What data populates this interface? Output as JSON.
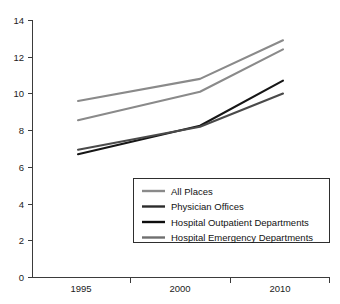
{
  "chart_data": {
    "type": "line",
    "title": "",
    "xlabel": "",
    "ylabel": "",
    "x": [
      "1995",
      "2000",
      "2010"
    ],
    "categories": [
      "1995",
      "2000",
      "2010"
    ],
    "xtick_labels": [
      "1995",
      "2000",
      "2010"
    ],
    "ytick_labels": [
      "0",
      "2",
      "4",
      "6",
      "8",
      "10",
      "12",
      "14"
    ],
    "ytick_values": [
      0,
      2,
      4,
      6,
      8,
      10,
      12,
      14
    ],
    "ylim": [
      0,
      14
    ],
    "grid": false,
    "legend_position": "inside-lower-right",
    "series": [
      {
        "name": "All Places",
        "color": "#8a8a8a",
        "values": [
          9.6,
          10.8,
          12.9
        ]
      },
      {
        "name": "Physician Offices",
        "color": "#8a8a8a",
        "values": [
          8.55,
          10.1,
          12.4
        ]
      },
      {
        "name": "Hospital Outpatient Departments",
        "color": "#161616",
        "values": [
          6.7,
          8.25,
          10.7
        ]
      },
      {
        "name": "Hospital Emergency Departments",
        "color": "#4a4a4a",
        "values": [
          6.95,
          8.2,
          10.0
        ]
      }
    ]
  },
  "legend": {
    "entries": [
      {
        "label": "All Places",
        "swatch_color": "#8a8a8a"
      },
      {
        "label": "Physician Offices",
        "swatch_color": "#2b2b2b"
      },
      {
        "label": "Hospital Outpatient Departments",
        "swatch_color": "#0e0e0e"
      },
      {
        "label": "Hospital Emergency Departments",
        "swatch_color": "#6f6f6f"
      }
    ]
  },
  "axes": {
    "y_ticks": [
      {
        "label": "14",
        "value": 14
      },
      {
        "label": "12",
        "value": 12
      },
      {
        "label": "10",
        "value": 10
      },
      {
        "label": "8",
        "value": 8
      },
      {
        "label": "6",
        "value": 6
      },
      {
        "label": "4",
        "value": 4
      },
      {
        "label": "2",
        "value": 2
      },
      {
        "label": "0",
        "value": 0
      }
    ],
    "x_ticks": [
      {
        "label": "1995"
      },
      {
        "label": "2000"
      },
      {
        "label": "2010"
      }
    ]
  },
  "colors": {
    "axis": "#3b3b3b",
    "text": "#121212",
    "background": "#ffffff",
    "legend_border": "#2e2e2e"
  }
}
